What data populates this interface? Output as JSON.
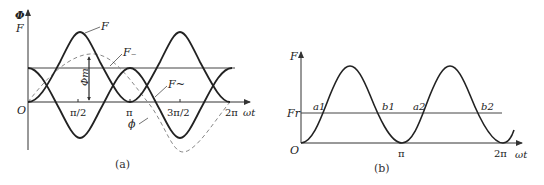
{
  "panel_a": {
    "caption": "(a)",
    "y_axis_label_top": "Φ",
    "y_axis_label_bottom": "F",
    "x_axis_label": "ωt",
    "origin_label": "O",
    "ticks": [
      "π/2",
      "π",
      "3π/2",
      "2π"
    ],
    "curve_labels": {
      "total_mmf": "F",
      "dc_component": "F₋",
      "ac_component": "F~",
      "flux": "ϕ",
      "flux_amplitude": "Φm"
    }
  },
  "panel_b": {
    "caption": "(b)",
    "y_axis_label": "F",
    "x_axis_label": "ωt",
    "origin_label": "O",
    "threshold_label": "Fr",
    "ticks": [
      "π",
      "2π"
    ],
    "points": [
      "a1",
      "b1",
      "a2",
      "b2"
    ]
  },
  "colors": {
    "curve": "#222222",
    "axis": "#333333",
    "dashed": "#888888",
    "background": "#ffffff"
  }
}
